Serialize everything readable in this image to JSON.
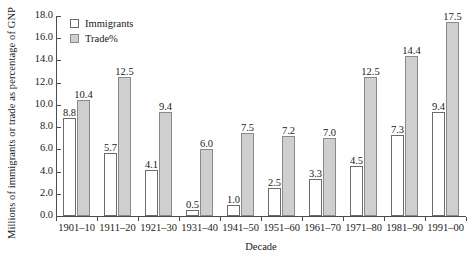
{
  "chart_data": {
    "type": "bar",
    "title": "",
    "xlabel": "Decade",
    "ylabel": "Millions of immigrants or trade as percentage of GNP",
    "ylim": [
      0,
      18
    ],
    "yticks": [
      "0.0",
      "2.0",
      "4.0",
      "6.0",
      "8.0",
      "10.0",
      "12.0",
      "14.0",
      "16.0",
      "18.0"
    ],
    "grid": false,
    "legend_position": "top-left",
    "categories": [
      "1901–10",
      "1911–20",
      "1921–30",
      "1931–40",
      "1941–50",
      "1951–60",
      "1961–70",
      "1971–80",
      "1981–90",
      "1991–00"
    ],
    "series": [
      {
        "name": "Immigrants",
        "color": "#ffffff",
        "values": [
          8.8,
          5.7,
          4.1,
          0.5,
          1.0,
          2.5,
          3.3,
          4.5,
          7.3,
          9.4
        ],
        "labels": [
          "8.8",
          "5.7",
          "4.1",
          "0.5",
          "1.0",
          "2.5",
          "3.3",
          "4.5",
          "7.3",
          "9.4"
        ]
      },
      {
        "name": "Trade%",
        "color": "#cfcfcf",
        "values": [
          10.4,
          12.5,
          9.4,
          6.0,
          7.5,
          7.2,
          7.0,
          12.5,
          14.4,
          17.5
        ],
        "labels": [
          "10.4",
          "12.5",
          "9.4",
          "6.0",
          "7.5",
          "7.2",
          "7.0",
          "12.5",
          "14.4",
          "17.5"
        ]
      }
    ]
  }
}
